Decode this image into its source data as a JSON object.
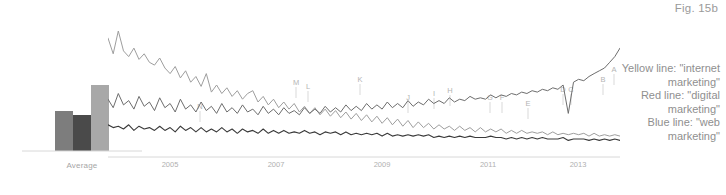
{
  "figure": {
    "label": "Fig. 15b"
  },
  "legend": {
    "lines": [
      "Yellow line: \"internet marketing\"",
      "Red line: \"digital marketing\"",
      "Blue line: \"web marketing\""
    ]
  },
  "bar_chart": {
    "axis_label": "Average",
    "categories": [
      "internet marketing",
      "digital marketing",
      "web marketing"
    ],
    "values": [
      58,
      52,
      96
    ],
    "colors": [
      "#7d7d7d",
      "#4a4a4a",
      "#a8a8a8"
    ]
  },
  "axis": {
    "ticks": [
      "2005",
      "2007",
      "2009",
      "2011",
      "2013"
    ],
    "tick_positions": [
      62,
      168,
      274,
      380,
      470
    ]
  },
  "markers": {
    "labels": [
      "N",
      "M",
      "L",
      "K",
      "J",
      "I",
      "H",
      "G",
      "F",
      "E",
      "D",
      "C",
      "B",
      "A"
    ]
  },
  "colors": {
    "yellow_line": "#9e9e9e",
    "red_line": "#6d6d6d",
    "blue_line": "#3a3a3a",
    "axis": "#d8d8d8",
    "text": "#9a9a9a",
    "background": "#ffffff"
  },
  "chart_data": {
    "type": "line",
    "title": "Fig. 15b",
    "xlabel": "",
    "ylabel": "",
    "grid": false,
    "legend_position": "right",
    "xlim": [
      2004,
      2014.5
    ],
    "ylim": [
      0,
      100
    ],
    "x_tick_labels": [
      "2005",
      "2007",
      "2009",
      "2011",
      "2013"
    ],
    "annotations": [
      "A",
      "B",
      "C",
      "D",
      "E",
      "F",
      "G",
      "H",
      "I",
      "J",
      "K",
      "L",
      "M",
      "N"
    ],
    "series": [
      {
        "name": "internet marketing",
        "legend": "Yellow line",
        "color": "#9e9e9e",
        "values": [
          83,
          72,
          88,
          74,
          70,
          76,
          68,
          72,
          66,
          64,
          69,
          62,
          58,
          63,
          55,
          60,
          52,
          56,
          49,
          58,
          45,
          50,
          44,
          48,
          42,
          46,
          40,
          44,
          46,
          38,
          42,
          36,
          40,
          34,
          38,
          33,
          37,
          31,
          35,
          30,
          34,
          29,
          33,
          28,
          32,
          27,
          31,
          26,
          30,
          25,
          29,
          24,
          28,
          23,
          27,
          22,
          26,
          21,
          25,
          20,
          24,
          20,
          23,
          19,
          22,
          19,
          21,
          18,
          21,
          18,
          20,
          17,
          20,
          17,
          19,
          17,
          19,
          16,
          18,
          16,
          18,
          16,
          17,
          16,
          17,
          15,
          17,
          15,
          16,
          15,
          16,
          15,
          16,
          14,
          16,
          14,
          15,
          14,
          15,
          14
        ]
      },
      {
        "name": "digital marketing",
        "legend": "Red line",
        "color": "#6d6d6d",
        "values": [
          40,
          34,
          44,
          36,
          39,
          33,
          42,
          35,
          38,
          32,
          41,
          34,
          37,
          31,
          40,
          33,
          36,
          31,
          38,
          32,
          35,
          30,
          37,
          31,
          34,
          30,
          36,
          31,
          33,
          29,
          35,
          30,
          33,
          29,
          34,
          30,
          32,
          29,
          34,
          30,
          33,
          30,
          35,
          31,
          34,
          31,
          36,
          32,
          35,
          32,
          37,
          33,
          36,
          33,
          38,
          34,
          37,
          34,
          39,
          35,
          38,
          36,
          40,
          37,
          39,
          37,
          41,
          38,
          40,
          39,
          42,
          40,
          41,
          40,
          43,
          41,
          43,
          42,
          44,
          43,
          45,
          44,
          46,
          45,
          47,
          46,
          48,
          47,
          50,
          30,
          52,
          54,
          53,
          56,
          58,
          60,
          62,
          66,
          70,
          76
        ]
      },
      {
        "name": "web marketing",
        "legend": "Blue line",
        "color": "#3a3a3a",
        "values": [
          22,
          20,
          21,
          19,
          22,
          18,
          21,
          19,
          20,
          18,
          21,
          18,
          20,
          17,
          21,
          18,
          20,
          17,
          20,
          17,
          19,
          17,
          20,
          17,
          19,
          16,
          19,
          17,
          18,
          16,
          19,
          16,
          18,
          16,
          18,
          16,
          17,
          16,
          18,
          16,
          17,
          15,
          17,
          16,
          17,
          15,
          17,
          15,
          16,
          15,
          16,
          15,
          16,
          14,
          16,
          14,
          15,
          14,
          15,
          14,
          15,
          14,
          15,
          13,
          14,
          13,
          14,
          13,
          14,
          13,
          14,
          13,
          13,
          13,
          14,
          13,
          13,
          12,
          13,
          12,
          13,
          12,
          13,
          12,
          13,
          12,
          12,
          12,
          13,
          11,
          12,
          12,
          12,
          11,
          12,
          11,
          12,
          11,
          12,
          11
        ]
      }
    ]
  }
}
